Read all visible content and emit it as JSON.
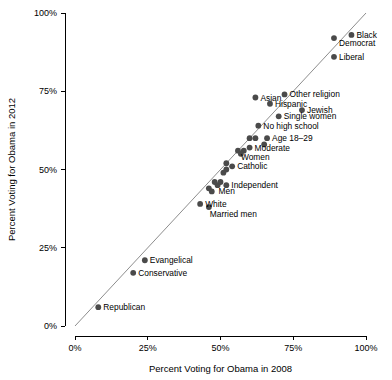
{
  "chart_data": {
    "type": "scatter",
    "title": "",
    "xlabel": "Percent Voting for Obama in 2008",
    "ylabel": "Percent Voting for Obama in 2012",
    "xlim": [
      0,
      100
    ],
    "ylim": [
      0,
      100
    ],
    "grid": false,
    "legend": "none",
    "xticks": [
      "0%",
      "25%",
      "50%",
      "75%",
      "100%"
    ],
    "xtick_values": [
      0,
      25,
      50,
      75,
      100
    ],
    "yticks": [
      "0%",
      "25%",
      "50%",
      "75%",
      "100%"
    ],
    "ytick_values": [
      0,
      25,
      50,
      75,
      100
    ],
    "reference_line": {
      "type": "identity",
      "from": [
        0,
        0
      ],
      "to": [
        100,
        100
      ],
      "color": "#808080"
    },
    "point_color": "#4a4a4a",
    "points": [
      {
        "label": "Black",
        "x": 95,
        "y": 93,
        "label_dx": 5,
        "label_dy": 3
      },
      {
        "label": "Democrat",
        "x": 89,
        "y": 92,
        "label_dx": 5,
        "label_dy": 8
      },
      {
        "label": "Liberal",
        "x": 89,
        "y": 86,
        "label_dx": 5,
        "label_dy": 3
      },
      {
        "label": "Other religion",
        "x": 72,
        "y": 74,
        "label_dx": 5,
        "label_dy": 3
      },
      {
        "label": "Asian",
        "x": 62,
        "y": 73,
        "label_dx": 5,
        "label_dy": 3
      },
      {
        "label": "Hispanic",
        "x": 67,
        "y": 71,
        "label_dx": 5,
        "label_dy": 3
      },
      {
        "label": "Jewish",
        "x": 78,
        "y": 69,
        "label_dx": 5,
        "label_dy": 3
      },
      {
        "label": "Single women",
        "x": 70,
        "y": 67,
        "label_dx": 5,
        "label_dy": 3
      },
      {
        "label": "No high school",
        "x": 63,
        "y": 64,
        "label_dx": 5,
        "label_dy": 3
      },
      {
        "label": "Age 18–29",
        "x": 66,
        "y": 60,
        "label_dx": 5,
        "label_dy": 3
      },
      {
        "label": "",
        "x": 60,
        "y": 60,
        "label_dx": 0,
        "label_dy": 0
      },
      {
        "label": "",
        "x": 62,
        "y": 60,
        "label_dx": 0,
        "label_dy": 0
      },
      {
        "label": "Moderate",
        "x": 60,
        "y": 57,
        "label_dx": 5,
        "label_dy": 3
      },
      {
        "label": "",
        "x": 65,
        "y": 58,
        "label_dx": 0,
        "label_dy": 0
      },
      {
        "label": "Women",
        "x": 56,
        "y": 56,
        "label_dx": 3,
        "label_dy": 9
      },
      {
        "label": "",
        "x": 58,
        "y": 56,
        "label_dx": 0,
        "label_dy": 0
      },
      {
        "label": "",
        "x": 57,
        "y": 55,
        "label_dx": 0,
        "label_dy": 0
      },
      {
        "label": "Catholic",
        "x": 54,
        "y": 51,
        "label_dx": 5,
        "label_dy": 3
      },
      {
        "label": "",
        "x": 52,
        "y": 52,
        "label_dx": 0,
        "label_dy": 0
      },
      {
        "label": "",
        "x": 52,
        "y": 50,
        "label_dx": 0,
        "label_dy": 0
      },
      {
        "label": "",
        "x": 51,
        "y": 49,
        "label_dx": 0,
        "label_dy": 0
      },
      {
        "label": "Independent",
        "x": 52,
        "y": 45,
        "label_dx": 5,
        "label_dy": 3
      },
      {
        "label": "Men",
        "x": 49,
        "y": 45,
        "label_dx": 1,
        "label_dy": 9
      },
      {
        "label": "",
        "x": 50,
        "y": 46,
        "label_dx": 0,
        "label_dy": 0
      },
      {
        "label": "",
        "x": 48,
        "y": 46,
        "label_dx": 0,
        "label_dy": 0
      },
      {
        "label": "",
        "x": 46,
        "y": 44,
        "label_dx": 0,
        "label_dy": 0
      },
      {
        "label": "",
        "x": 47,
        "y": 43,
        "label_dx": 0,
        "label_dy": 0
      },
      {
        "label": "White",
        "x": 43,
        "y": 39,
        "label_dx": 5,
        "label_dy": 3
      },
      {
        "label": "Married men",
        "x": 46,
        "y": 38,
        "label_dx": 1,
        "label_dy": 10
      },
      {
        "label": "Evangelical",
        "x": 24,
        "y": 21,
        "label_dx": 5,
        "label_dy": 3
      },
      {
        "label": "Conservative",
        "x": 20,
        "y": 17,
        "label_dx": 5,
        "label_dy": 3
      },
      {
        "label": "Republican",
        "x": 8,
        "y": 6,
        "label_dx": 5,
        "label_dy": 3
      }
    ]
  }
}
